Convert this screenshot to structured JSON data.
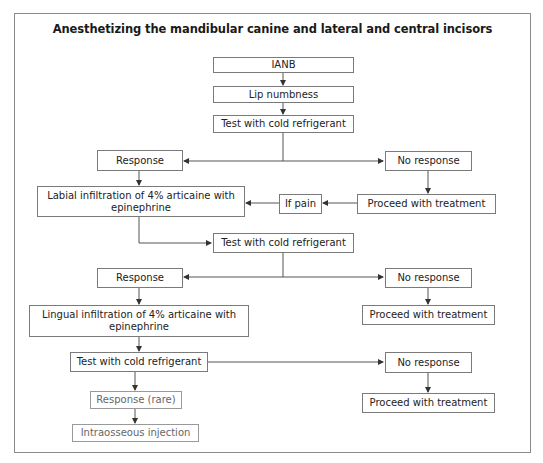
{
  "title": "Anesthetizing the mandibular canine and lateral and central incisors",
  "nodes": {
    "ianb": "IANB",
    "lip_numbness": "Lip numbness",
    "test1": "Test with cold refrigerant",
    "response1": "Response",
    "no_response1": "No response",
    "labial_infiltration": "Labial infiltration of 4% articaine with epinephrine",
    "if_pain": "If pain",
    "proceed1": "Proceed with treatment",
    "test2": "Test with cold refrigerant",
    "response2": "Response",
    "no_response2": "No response",
    "lingual_infiltration": "Lingual infiltration of 4% articaine with epinephrine",
    "proceed2": "Proceed with treatment",
    "test3": "Test with cold refrigerant",
    "no_response3": "No response",
    "response_rare": "Response (rare)",
    "proceed3": "Proceed with treatment",
    "intraosseous": "Intraosseous injection"
  },
  "colors": {
    "border": "#7a7a7a",
    "text": "#222222",
    "muted_text": "#666666",
    "line": "#555555"
  }
}
